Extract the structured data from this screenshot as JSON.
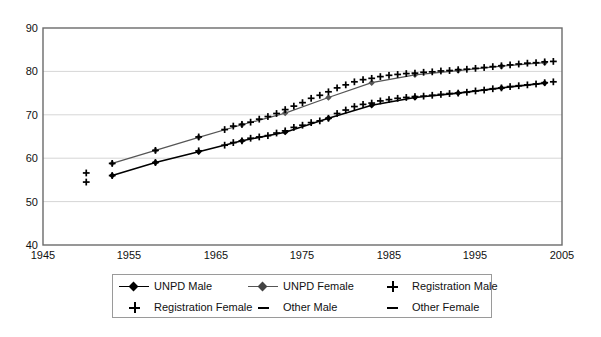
{
  "chart_data": {
    "type": "line",
    "title": "",
    "subtitle": "",
    "xlabel": "",
    "ylabel": "",
    "xlim": [
      1945,
      2005
    ],
    "ylim": [
      40,
      90
    ],
    "xticks": [
      1945,
      1955,
      1965,
      1975,
      1985,
      1995,
      2005
    ],
    "yticks": [
      40,
      50,
      60,
      70,
      80,
      90
    ],
    "grid": "horizontal",
    "legend_position": "below-center",
    "legend_columns": 3,
    "series": [
      {
        "name": "UNPD Male",
        "marker": "diamond",
        "line": "solid",
        "color": "#000000",
        "x": [
          1953,
          1958,
          1963,
          1968,
          1973,
          1978,
          1983,
          1988,
          1993,
          1998,
          2003
        ],
        "values": [
          56.0,
          59.0,
          61.5,
          64.0,
          66.0,
          69.2,
          72.2,
          74.0,
          75.0,
          76.2,
          77.3
        ]
      },
      {
        "name": "UNPD Female",
        "marker": "diamond",
        "line": "solid",
        "color": "#555555",
        "x": [
          1953,
          1958,
          1963,
          1968,
          1973,
          1978,
          1983,
          1988,
          1993,
          1998,
          2003
        ],
        "values": [
          58.8,
          61.8,
          64.8,
          67.7,
          70.4,
          74.0,
          77.4,
          79.2,
          80.2,
          81.2,
          82.0
        ]
      },
      {
        "name": "Registration Male",
        "marker": "plus",
        "line": "none",
        "color": "#000000",
        "x": [
          1950,
          1953,
          1958,
          1963,
          1966,
          1967,
          1968,
          1969,
          1970,
          1971,
          1972,
          1973,
          1974,
          1975,
          1976,
          1977,
          1978,
          1979,
          1980,
          1981,
          1982,
          1983,
          1984,
          1985,
          1986,
          1987,
          1988,
          1989,
          1990,
          1991,
          1992,
          1993,
          1994,
          1995,
          1996,
          1997,
          1998,
          1999,
          2000,
          2001,
          2002,
          2003,
          2004
        ],
        "values": [
          54.5,
          56.0,
          59.0,
          61.7,
          63.0,
          63.6,
          64.0,
          64.6,
          64.9,
          65.2,
          65.8,
          66.3,
          67.1,
          67.6,
          68.2,
          68.6,
          69.2,
          70.3,
          71.1,
          71.9,
          72.4,
          72.7,
          73.2,
          73.5,
          73.8,
          74.0,
          74.2,
          74.3,
          74.5,
          74.7,
          74.9,
          75.0,
          75.2,
          75.5,
          75.7,
          76.0,
          76.2,
          76.5,
          76.7,
          76.9,
          77.1,
          77.4,
          77.6
        ]
      },
      {
        "name": "Registration Female",
        "marker": "plus",
        "line": "none",
        "color": "#000000",
        "x": [
          1950,
          1953,
          1958,
          1963,
          1966,
          1967,
          1968,
          1969,
          1970,
          1971,
          1972,
          1973,
          1974,
          1975,
          1976,
          1977,
          1978,
          1979,
          1980,
          1981,
          1982,
          1983,
          1984,
          1985,
          1986,
          1987,
          1988,
          1989,
          1990,
          1991,
          1992,
          1993,
          1994,
          1995,
          1996,
          1997,
          1998,
          1999,
          2000,
          2001,
          2002,
          2003,
          2004
        ],
        "values": [
          56.6,
          58.8,
          61.8,
          64.9,
          66.6,
          67.4,
          67.8,
          68.3,
          69.0,
          69.6,
          70.3,
          71.2,
          72.0,
          72.8,
          73.8,
          74.5,
          75.3,
          76.2,
          76.9,
          77.6,
          78.1,
          78.4,
          78.8,
          79.1,
          79.3,
          79.5,
          79.6,
          79.8,
          79.9,
          80.1,
          80.2,
          80.4,
          80.5,
          80.7,
          80.9,
          81.1,
          81.3,
          81.5,
          81.7,
          81.9,
          82.0,
          82.2,
          82.3
        ]
      },
      {
        "name": "Other Male",
        "marker": "dash",
        "line": "none",
        "color": "#000000",
        "x": [],
        "values": []
      },
      {
        "name": "Other Female",
        "marker": "dash",
        "line": "none",
        "color": "#000000",
        "x": [],
        "values": []
      }
    ]
  },
  "axes": {
    "y_tick_labels": [
      "90",
      "80",
      "70",
      "60",
      "50",
      "40"
    ],
    "x_tick_labels": [
      "1945",
      "1955",
      "1965",
      "1975",
      "1985",
      "1995",
      "2005"
    ]
  },
  "legend": {
    "entries": [
      {
        "label": "UNPD Male",
        "key": "line-diamond-black-icon"
      },
      {
        "label": "UNPD Female",
        "key": "line-diamond-grey-icon"
      },
      {
        "label": "Registration Male",
        "key": "plus-marker-icon"
      },
      {
        "label": "Registration Female",
        "key": "plus-marker-icon"
      },
      {
        "label": "Other Male",
        "key": "dash-marker-icon"
      },
      {
        "label": "Other Female",
        "key": "dash-marker-icon"
      }
    ]
  },
  "colors": {
    "frame": "#6b6b6b",
    "grid": "#d6d6d6",
    "unpd_male": "#000000",
    "unpd_female": "#555555",
    "registration": "#000000",
    "background": "#ffffff"
  }
}
